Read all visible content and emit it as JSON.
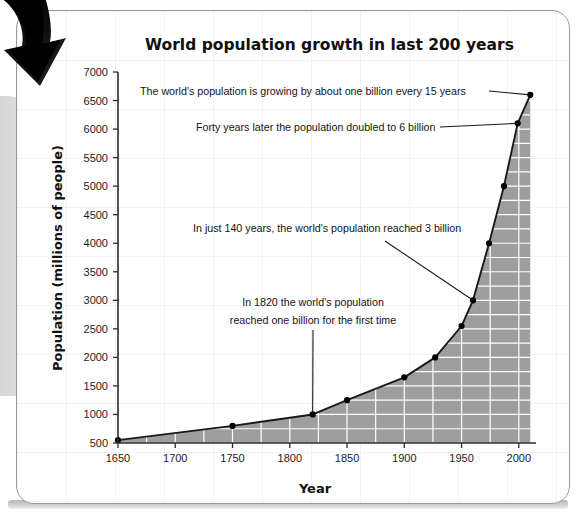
{
  "figure": {
    "title": "World population growth in last 200 years",
    "xlabel": "Year",
    "ylabel": "Population (millions of people)",
    "arrow_icon": "curved-down-arrow-icon"
  },
  "chart_data": {
    "type": "area",
    "title": "World population growth in last 200 years",
    "xlabel": "Year",
    "ylabel": "Population (millions of people)",
    "xlim": [
      1650,
      2015
    ],
    "ylim": [
      500,
      7000
    ],
    "xticks": [
      1650,
      1700,
      1750,
      1800,
      1850,
      1900,
      1950,
      2000
    ],
    "yticks": [
      500,
      1000,
      1500,
      2000,
      2500,
      3000,
      3500,
      4000,
      4500,
      5000,
      5500,
      6000,
      6500,
      7000
    ],
    "xtick_labels": [
      "1650",
      "1700",
      "1750",
      "1800",
      "1850",
      "1900",
      "1950",
      "2000"
    ],
    "ytick_labels": [
      "500",
      "1000",
      "1500",
      "2000",
      "2500",
      "3000",
      "3500",
      "4000",
      "4500",
      "5000",
      "5500",
      "6000",
      "6500",
      "7000"
    ],
    "x_minor_step": 25,
    "y_minor_step": 250,
    "grid": "white gridlines inside shaded area",
    "legend": "none",
    "fill_color": "#9e9e9e",
    "line_color": "#1a1a1a",
    "marker_color": "#000000",
    "x": [
      1650,
      1750,
      1820,
      1850,
      1900,
      1927,
      1950,
      1960,
      1974,
      1987,
      1999,
      2010
    ],
    "values": [
      550,
      800,
      1000,
      1250,
      1650,
      2000,
      2550,
      3000,
      4000,
      5000,
      6100,
      6600
    ],
    "points": [
      {
        "year": 1650,
        "population": 550
      },
      {
        "year": 1750,
        "population": 800
      },
      {
        "year": 1820,
        "population": 1000
      },
      {
        "year": 1850,
        "population": 1250
      },
      {
        "year": 1900,
        "population": 1650
      },
      {
        "year": 1927,
        "population": 2000
      },
      {
        "year": 1950,
        "population": 2550
      },
      {
        "year": 1960,
        "population": 3000
      },
      {
        "year": 1974,
        "population": 4000
      },
      {
        "year": 1987,
        "population": 5000
      },
      {
        "year": 1999,
        "population": 6100
      },
      {
        "year": 2010,
        "population": 6600
      }
    ],
    "annotations": [
      {
        "id": "ann-15-years",
        "text": "The world's population is growing by about one billion every 15 years",
        "target_year": 2010,
        "target_population": 6600
      },
      {
        "id": "ann-6-billion",
        "text": "Forty years later the population doubled to 6 billion",
        "target_year": 1999,
        "target_population": 6100
      },
      {
        "id": "ann-3-billion",
        "text": "In just 140 years, the world's population reached 3 billion",
        "target_year": 1960,
        "target_population": 3000
      },
      {
        "id": "ann-one-billion-line1",
        "text": "In 1820 the world's population",
        "target_year": 1820,
        "target_population": 1000
      },
      {
        "id": "ann-one-billion-line2",
        "text": "reached one billion for the first time",
        "target_year": 1820,
        "target_population": 1000
      }
    ]
  },
  "colors": {
    "area_fill": "#9e9e9e",
    "line": "#1a1a1a",
    "axis": "#2b2b2b",
    "card_border": "#9a9a9a",
    "gridline_inside": "#ffffff",
    "text": "#141414"
  }
}
